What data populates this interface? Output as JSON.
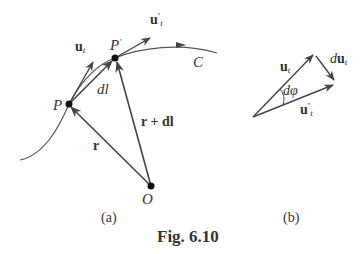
{
  "figure": {
    "caption": "Fig. 6.10",
    "panel_a_label": "(a)",
    "panel_b_label": "(b)"
  },
  "panel_a": {
    "curve_label": "C",
    "point_P": "P",
    "point_P_prime": "P",
    "prime_mark": "'",
    "origin": "O",
    "vector_r": "r",
    "vector_r_plus_dl": "r + dl",
    "vector_dl": "dl",
    "unit_tangent": {
      "base": "u",
      "sub": "t"
    },
    "unit_tangent_prime": {
      "base": "u",
      "sub": "t",
      "sup": "'"
    }
  },
  "panel_b": {
    "unit_tangent": {
      "base": "u",
      "sub": "t"
    },
    "unit_tangent_prime": {
      "base": "u",
      "sub": "t",
      "sup": "'"
    },
    "d_unit_tangent": {
      "prefix": "d",
      "base": "u",
      "sub": "t"
    },
    "angle": "dφ"
  },
  "colors": {
    "stroke": "#444444",
    "point": "#111111"
  }
}
